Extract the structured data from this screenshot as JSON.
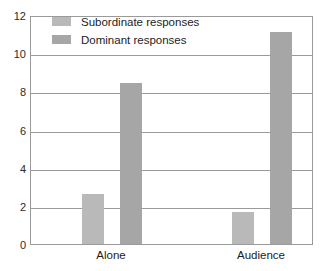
{
  "chart_data": {
    "type": "bar",
    "title": "",
    "subtitle": "",
    "xlabel": "",
    "ylabel": "",
    "categories": [
      "Alone",
      "Audience"
    ],
    "series": [
      {
        "name": "Subordinate responses",
        "values": [
          2.6,
          1.7
        ],
        "color": "#b9b9b9"
      },
      {
        "name": "Dominant responses",
        "values": [
          8.45,
          11.1
        ],
        "color": "#a6a6a6"
      }
    ],
    "ylim": [
      0,
      12
    ],
    "yticks": [
      0,
      2,
      4,
      6,
      8,
      10,
      12
    ],
    "ytick_labels": [
      "0",
      "2",
      "4",
      "6",
      "8",
      "10",
      "12"
    ],
    "grid": true,
    "grid_axis": "y",
    "legend_position": "top-left-inside",
    "frame_color": "#9a9a9a",
    "background": "#ffffff"
  },
  "legend": {
    "items": [
      {
        "label": "Subordinate responses",
        "swatch_name": "legend-swatch-subordinate"
      },
      {
        "label": "Dominant responses",
        "swatch_name": "legend-swatch-dominant"
      }
    ]
  }
}
